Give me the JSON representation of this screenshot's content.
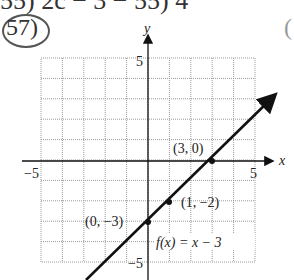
{
  "header": {
    "prev_line": "55) 2c − 3 − 55) 4",
    "problem_number": "57)",
    "right_fragment": "("
  },
  "chart_data": {
    "type": "line",
    "title": "",
    "xlabel": "x",
    "ylabel": "y",
    "xlim": [
      -5,
      5
    ],
    "ylim": [
      -5,
      5
    ],
    "grid": true,
    "tick_labels": {
      "x": [
        "−5",
        "5"
      ],
      "y": [
        "5",
        "−5"
      ]
    },
    "series": [
      {
        "name": "f(x) = x − 3",
        "slope": 1,
        "intercept": -3,
        "x": [
          -3,
          6
        ],
        "y": [
          -6,
          3
        ]
      }
    ],
    "points": [
      {
        "label": "(3, 0)",
        "x": 3,
        "y": 0
      },
      {
        "label": "(1, −2)",
        "x": 1,
        "y": -2
      },
      {
        "label": "(0, −3)",
        "x": 0,
        "y": -3
      }
    ],
    "annotations": [
      {
        "text": "f(x) = x − 3",
        "x": 0.5,
        "y": -4
      }
    ]
  }
}
